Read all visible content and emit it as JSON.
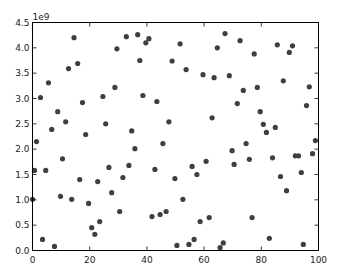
{
  "chart_data": {
    "type": "scatter",
    "title": "",
    "xlabel": "",
    "ylabel": "",
    "y_offset_label": "1e9",
    "xlim": [
      0,
      100
    ],
    "ylim": [
      0,
      4.5
    ],
    "y_scale_multiplier": 1000000000,
    "grid": false,
    "legend": null,
    "x_ticks": [
      0,
      20,
      40,
      60,
      80,
      100
    ],
    "x_tick_labels": [
      "0",
      "20",
      "40",
      "60",
      "80",
      "100"
    ],
    "y_ticks": [
      0.0,
      0.5,
      1.0,
      1.5,
      2.0,
      2.5,
      3.0,
      3.5,
      4.0,
      4.5
    ],
    "y_tick_labels": [
      "0.0",
      "0.5",
      "1.0",
      "1.5",
      "2.0",
      "2.5",
      "3.0",
      "3.5",
      "4.0",
      "4.5"
    ],
    "marker_color": "#3f3f3f",
    "series": [
      {
        "name": "points",
        "points": [
          [
            0.0,
            1.01
          ],
          [
            0.7,
            1.58
          ],
          [
            1.4,
            2.15
          ],
          [
            2.8,
            3.02
          ],
          [
            3.5,
            0.22
          ],
          [
            4.6,
            1.58
          ],
          [
            5.6,
            3.31
          ],
          [
            6.7,
            2.39
          ],
          [
            7.7,
            0.08
          ],
          [
            8.8,
            2.74
          ],
          [
            9.8,
            1.07
          ],
          [
            10.5,
            1.81
          ],
          [
            11.6,
            2.54
          ],
          [
            12.6,
            3.59
          ],
          [
            13.7,
            1.01
          ],
          [
            14.5,
            4.2
          ],
          [
            15.8,
            3.69
          ],
          [
            16.5,
            1.4
          ],
          [
            17.5,
            2.92
          ],
          [
            18.6,
            2.29
          ],
          [
            19.6,
            0.93
          ],
          [
            20.7,
            0.45
          ],
          [
            21.8,
            0.32
          ],
          [
            22.8,
            1.36
          ],
          [
            23.5,
            0.57
          ],
          [
            24.6,
            3.04
          ],
          [
            25.6,
            2.5
          ],
          [
            26.7,
            1.64
          ],
          [
            27.7,
            1.14
          ],
          [
            28.8,
            3.22
          ],
          [
            29.5,
            3.98
          ],
          [
            30.5,
            0.77
          ],
          [
            31.6,
            1.44
          ],
          [
            32.8,
            4.22
          ],
          [
            33.7,
            1.68
          ],
          [
            34.7,
            2.36
          ],
          [
            35.8,
            2.01
          ],
          [
            36.8,
            4.26
          ],
          [
            37.5,
            3.75
          ],
          [
            38.6,
            3.06
          ],
          [
            39.6,
            4.1
          ],
          [
            40.7,
            4.18
          ],
          [
            41.8,
            0.67
          ],
          [
            42.8,
            1.6
          ],
          [
            43.5,
            2.94
          ],
          [
            44.6,
            0.71
          ],
          [
            45.6,
            2.11
          ],
          [
            46.7,
            0.77
          ],
          [
            47.7,
            2.54
          ],
          [
            48.8,
            3.74
          ],
          [
            49.8,
            1.42
          ],
          [
            50.5,
            0.1
          ],
          [
            51.6,
            4.08
          ],
          [
            52.6,
            1.01
          ],
          [
            53.7,
            3.57
          ],
          [
            54.7,
            0.12
          ],
          [
            55.8,
            1.66
          ],
          [
            56.5,
            0.22
          ],
          [
            57.5,
            1.5
          ],
          [
            58.6,
            0.57
          ],
          [
            59.6,
            3.47
          ],
          [
            60.7,
            1.76
          ],
          [
            61.8,
            0.65
          ],
          [
            62.8,
            2.62
          ],
          [
            63.5,
            3.41
          ],
          [
            64.6,
            4.0
          ],
          [
            65.6,
            0.06
          ],
          [
            66.7,
            0.15
          ],
          [
            67.3,
            4.28
          ],
          [
            68.8,
            3.45
          ],
          [
            69.8,
            1.97
          ],
          [
            70.5,
            1.7
          ],
          [
            71.6,
            2.9
          ],
          [
            72.6,
            4.14
          ],
          [
            73.7,
            3.16
          ],
          [
            74.7,
            2.11
          ],
          [
            75.8,
            1.8
          ],
          [
            76.8,
            0.65
          ],
          [
            77.5,
            3.88
          ],
          [
            78.6,
            3.22
          ],
          [
            79.6,
            2.74
          ],
          [
            80.7,
            2.49
          ],
          [
            81.8,
            2.33
          ],
          [
            82.8,
            0.24
          ],
          [
            83.9,
            1.83
          ],
          [
            84.9,
            2.43
          ],
          [
            85.6,
            4.06
          ],
          [
            86.7,
            1.46
          ],
          [
            87.7,
            3.35
          ],
          [
            88.8,
            1.18
          ],
          [
            89.8,
            3.91
          ],
          [
            90.9,
            4.04
          ],
          [
            91.9,
            1.87
          ],
          [
            93.0,
            1.87
          ],
          [
            94.0,
            1.54
          ],
          [
            94.7,
            0.12
          ],
          [
            95.8,
            2.86
          ],
          [
            96.8,
            3.23
          ],
          [
            97.9,
            1.91
          ],
          [
            98.9,
            2.17
          ]
        ]
      }
    ]
  }
}
